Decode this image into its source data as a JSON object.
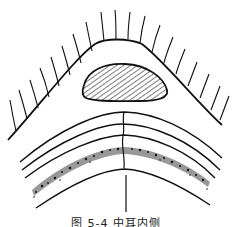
{
  "figure": {
    "caption": "图 5-4  中耳内侧",
    "stroke_color": "#111111",
    "background": "#ffffff",
    "elements": [
      "outer-hair-curve",
      "hatched-oval",
      "arc-layer-1",
      "arc-layer-2",
      "arc-layer-3",
      "stippled-band",
      "arc-layer-4",
      "center-seam",
      "vertical-pointer-line"
    ]
  }
}
